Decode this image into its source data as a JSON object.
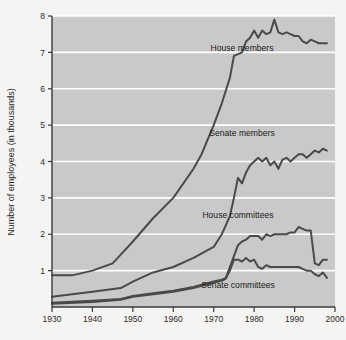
{
  "chart_data": {
    "type": "line",
    "title": "",
    "xlabel": "",
    "ylabel": "Number of employees (in thousands)",
    "xlim": [
      1930,
      2000
    ],
    "ylim": [
      0,
      8
    ],
    "grid": true,
    "legend_position": "inline-labels",
    "xticks": [
      1930,
      1940,
      1950,
      1960,
      1970,
      1980,
      1990,
      2000
    ],
    "yticks": [
      1,
      2,
      3,
      4,
      5,
      6,
      7,
      8
    ],
    "xtick_labels": [
      "1930",
      "1940",
      "1950",
      "1960",
      "1970",
      "1980",
      "1990",
      "2000"
    ],
    "ytick_labels": [
      "1",
      "2",
      "3",
      "4",
      "5",
      "6",
      "7",
      "8"
    ],
    "colors": {
      "plot_background": "#c9c9c9",
      "figure_background": "#f5f4f2",
      "gridline": "#ffffff",
      "line": "#4a4a4a",
      "axis": "#3a3a3a"
    },
    "series": [
      {
        "name": "House members",
        "label": "House members",
        "label_x": 1977,
        "label_y": 7.05,
        "x": [
          1930,
          1935,
          1940,
          1945,
          1947,
          1950,
          1955,
          1960,
          1965,
          1967,
          1970,
          1972,
          1974,
          1975,
          1976,
          1977,
          1978,
          1979,
          1980,
          1981,
          1982,
          1983,
          1984,
          1985,
          1986,
          1987,
          1988,
          1989,
          1990,
          1991,
          1992,
          1993,
          1994,
          1995,
          1996,
          1997,
          1998
        ],
        "values": [
          0.87,
          0.87,
          1.0,
          1.2,
          1.44,
          1.8,
          2.44,
          3.0,
          3.8,
          4.2,
          5.0,
          5.6,
          6.3,
          6.9,
          6.95,
          7.0,
          7.3,
          7.4,
          7.6,
          7.4,
          7.6,
          7.5,
          7.55,
          7.9,
          7.55,
          7.5,
          7.55,
          7.5,
          7.45,
          7.45,
          7.3,
          7.25,
          7.35,
          7.3,
          7.25,
          7.25,
          7.25
        ]
      },
      {
        "name": "Senate members",
        "label": "Senate members",
        "label_x": 1977,
        "label_y": 4.7,
        "x": [
          1930,
          1935,
          1940,
          1947,
          1950,
          1955,
          1960,
          1965,
          1970,
          1972,
          1974,
          1975,
          1976,
          1977,
          1978,
          1979,
          1980,
          1981,
          1982,
          1983,
          1984,
          1985,
          1986,
          1987,
          1988,
          1989,
          1990,
          1991,
          1992,
          1993,
          1994,
          1995,
          1996,
          1997,
          1998
        ],
        "values": [
          0.28,
          0.35,
          0.42,
          0.52,
          0.7,
          0.95,
          1.1,
          1.35,
          1.65,
          2.0,
          2.5,
          3.0,
          3.55,
          3.4,
          3.7,
          3.9,
          4.0,
          4.1,
          4.0,
          4.1,
          3.9,
          4.0,
          3.8,
          4.05,
          4.1,
          4.0,
          4.1,
          4.2,
          4.2,
          4.1,
          4.2,
          4.3,
          4.25,
          4.35,
          4.3
        ]
      },
      {
        "name": "House committees",
        "label": "House committees",
        "label_x": 1976,
        "label_y": 2.45,
        "x": [
          1930,
          1940,
          1947,
          1950,
          1955,
          1960,
          1965,
          1970,
          1972,
          1973,
          1974,
          1975,
          1976,
          1977,
          1978,
          1979,
          1980,
          1981,
          1982,
          1983,
          1984,
          1985,
          1986,
          1987,
          1988,
          1989,
          1990,
          1991,
          1992,
          1993,
          1994,
          1995,
          1996,
          1997,
          1998
        ],
        "values": [
          0.12,
          0.17,
          0.22,
          0.3,
          0.38,
          0.45,
          0.55,
          0.7,
          0.75,
          0.8,
          1.1,
          1.4,
          1.7,
          1.8,
          1.85,
          1.95,
          1.95,
          1.95,
          1.85,
          2.0,
          1.95,
          2.0,
          2.0,
          2.0,
          2.0,
          2.05,
          2.05,
          2.2,
          2.15,
          2.1,
          2.1,
          1.2,
          1.15,
          1.3,
          1.3
        ]
      },
      {
        "name": "Senate committees",
        "label": "Senate committees",
        "label_x": 1976,
        "label_y": 0.52,
        "x": [
          1930,
          1940,
          1947,
          1950,
          1955,
          1960,
          1965,
          1970,
          1972,
          1973,
          1974,
          1975,
          1976,
          1977,
          1978,
          1979,
          1980,
          1981,
          1982,
          1983,
          1984,
          1985,
          1986,
          1987,
          1988,
          1989,
          1990,
          1991,
          1992,
          1993,
          1994,
          1995,
          1996,
          1997,
          1998
        ],
        "values": [
          0.09,
          0.14,
          0.2,
          0.28,
          0.35,
          0.42,
          0.52,
          0.67,
          0.72,
          0.78,
          1.0,
          1.3,
          1.3,
          1.25,
          1.35,
          1.25,
          1.3,
          1.1,
          1.05,
          1.15,
          1.1,
          1.1,
          1.1,
          1.1,
          1.1,
          1.1,
          1.1,
          1.1,
          1.05,
          1.0,
          1.0,
          0.9,
          0.85,
          0.95,
          0.8
        ]
      }
    ]
  },
  "caption": {
    "text": ""
  }
}
